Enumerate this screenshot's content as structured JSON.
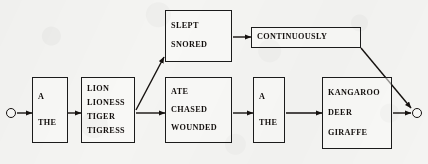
{
  "diagram": {
    "ink_color": "#15110f",
    "paper_color": "#f4f4f2",
    "start_node_label": "start",
    "end_node_label": "end",
    "nodes": [
      {
        "id": "determiner-1",
        "name": "determiner-box-1",
        "words": [
          "A",
          "THE"
        ],
        "x": 32,
        "y": 77,
        "w": 36,
        "h": 66
      },
      {
        "id": "subject-noun",
        "name": "subject-noun-box",
        "words": [
          "LION",
          "LIONESS",
          "TIGER",
          "TIGRESS"
        ],
        "x": 81,
        "y": 77,
        "w": 54,
        "h": 66
      },
      {
        "id": "intransitive-verb",
        "name": "intransitive-verb-box",
        "words": [
          "SLEPT",
          "SNORED"
        ],
        "x": 165,
        "y": 10,
        "w": 67,
        "h": 52
      },
      {
        "id": "transitive-verb",
        "name": "transitive-verb-box",
        "words": [
          "ATE",
          "CHASED",
          "WOUNDED"
        ],
        "x": 165,
        "y": 77,
        "w": 67,
        "h": 66
      },
      {
        "id": "adverb",
        "name": "adverb-box",
        "words": [
          "CONTINUOUSLY"
        ],
        "x": 251,
        "y": 27,
        "w": 110,
        "h": 21
      },
      {
        "id": "determiner-2",
        "name": "determiner-box-2",
        "words": [
          "A",
          "THE"
        ],
        "x": 253,
        "y": 77,
        "w": 32,
        "h": 66
      },
      {
        "id": "object-noun",
        "name": "object-noun-box",
        "words": [
          "KANGAROO",
          "DEER",
          "GIRAFFE"
        ],
        "x": 322,
        "y": 77,
        "w": 70,
        "h": 72
      }
    ],
    "terminals": [
      {
        "id": "start",
        "name": "start-terminal",
        "cx": 11,
        "cy": 113
      },
      {
        "id": "end",
        "name": "end-terminal",
        "cx": 417,
        "cy": 113
      }
    ],
    "edges": [
      {
        "id": "e1",
        "name": "edge-start-to-determiner1",
        "from": "start",
        "to": "determiner-1",
        "x1": 17,
        "y1": 113,
        "x2": 32,
        "y2": 113
      },
      {
        "id": "e2",
        "name": "edge-determiner1-to-subject",
        "from": "determiner-1",
        "to": "subject-noun",
        "x1": 68,
        "y1": 113,
        "x2": 81,
        "y2": 113
      },
      {
        "id": "e3",
        "name": "edge-subject-to-intransitive",
        "from": "subject-noun",
        "to": "intransitive-verb",
        "x1": 136,
        "y1": 110,
        "x2": 164,
        "y2": 57
      },
      {
        "id": "e4",
        "name": "edge-subject-to-transitive",
        "from": "subject-noun",
        "to": "transitive-verb",
        "x1": 136,
        "y1": 113,
        "x2": 165,
        "y2": 113
      },
      {
        "id": "e5",
        "name": "edge-intransitive-to-adverb",
        "from": "intransitive-verb",
        "to": "adverb",
        "x1": 233,
        "y1": 37,
        "x2": 251,
        "y2": 37
      },
      {
        "id": "e6",
        "name": "edge-transitive-to-determiner2",
        "from": "transitive-verb",
        "to": "determiner-2",
        "x1": 233,
        "y1": 113,
        "x2": 253,
        "y2": 113
      },
      {
        "id": "e7",
        "name": "edge-determiner2-to-object",
        "from": "determiner-2",
        "to": "object-noun",
        "x1": 286,
        "y1": 113,
        "x2": 322,
        "y2": 113
      },
      {
        "id": "e8",
        "name": "edge-object-to-end",
        "from": "object-noun",
        "to": "end",
        "x1": 393,
        "y1": 113,
        "x2": 411,
        "y2": 113
      },
      {
        "id": "e9",
        "name": "edge-adverb-to-end",
        "from": "adverb",
        "to": "end",
        "x1": 361,
        "y1": 48,
        "x2": 411,
        "y2": 108
      }
    ]
  }
}
